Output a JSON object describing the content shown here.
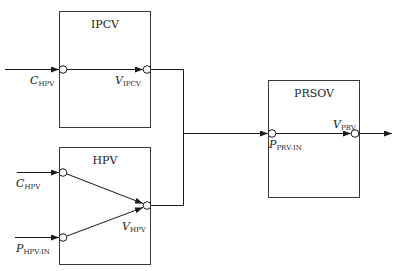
{
  "diagram": {
    "type": "block-diagram",
    "blocks": [
      {
        "id": "ipcv",
        "title": "IPCV"
      },
      {
        "id": "hpv",
        "title": "HPV"
      },
      {
        "id": "prsov",
        "title": "PRSOV"
      }
    ],
    "signals": {
      "ipcv_in": {
        "main": "C",
        "sub": "HPV"
      },
      "ipcv_out": {
        "main": "V",
        "sub": "IPCV"
      },
      "hpv_in1": {
        "main": "C",
        "sub": "HPV"
      },
      "hpv_in2": {
        "main": "P",
        "sub": "HPV-IN"
      },
      "hpv_out": {
        "main": "V",
        "sub": "HPV"
      },
      "prsov_in": {
        "main": "P",
        "sub": "PRV-IN"
      },
      "prsov_out": {
        "main": "V",
        "sub": "PRV"
      }
    },
    "connections": [
      {
        "from": "external",
        "to": "ipcv_in"
      },
      {
        "from": "ipcv_in",
        "to": "ipcv_out"
      },
      {
        "from": "external",
        "to": "hpv_in1"
      },
      {
        "from": "external",
        "to": "hpv_in2"
      },
      {
        "from": "hpv_in1",
        "to": "hpv_out"
      },
      {
        "from": "hpv_in2",
        "to": "hpv_out"
      },
      {
        "from": "ipcv_out",
        "to": "prsov_in",
        "via": "junction"
      },
      {
        "from": "hpv_out",
        "to": "prsov_in",
        "via": "junction"
      },
      {
        "from": "prsov_in",
        "to": "prsov_out"
      },
      {
        "from": "prsov_out",
        "to": "external"
      }
    ]
  }
}
